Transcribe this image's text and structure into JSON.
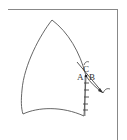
{
  "diagram": {
    "type": "pattern-piece",
    "labels": {
      "a": "A",
      "b": "B",
      "c": "C"
    },
    "colors": {
      "stroke": "#555555",
      "frame": "#777777",
      "background": "#ffffff"
    }
  }
}
